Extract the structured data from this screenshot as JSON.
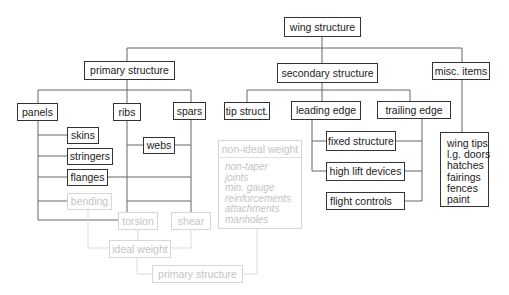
{
  "diagram": {
    "root": "wing structure",
    "level1": {
      "primary": "primary structure",
      "secondary": "secondary structure",
      "misc": "misc. items"
    },
    "primary_children": {
      "panels": "panels",
      "ribs": "ribs",
      "spars": "spars"
    },
    "panel_components": {
      "skins": "skins",
      "stringers": "stringers",
      "flanges": "flanges",
      "bending": "bending"
    },
    "spar_components": {
      "webs": "webs"
    },
    "loads": {
      "torsion": "torsion",
      "shear": "shear",
      "ideal_weight": "ideal weight",
      "primary_structure_result": "primary structure"
    },
    "non_ideal": {
      "title": "non-ideal weight",
      "items": [
        "non-taper",
        "joints",
        "min. gauge",
        "reinforcements",
        "attachments",
        "manholes"
      ]
    },
    "secondary_children": {
      "tip": "tip struct.",
      "leading_edge": "leading edge",
      "trailing_edge": "trailing edge"
    },
    "edge_components": {
      "fixed": "fixed structure",
      "high_lift": "high lift devices",
      "flight_controls": "flight controls"
    },
    "misc_items": [
      "wing tips",
      "l.g. doors",
      "hatches",
      "fairings",
      "fences",
      "paint"
    ]
  },
  "colors": {
    "solid_line": "#555555",
    "faint_line": "#d6d6d6",
    "faint_text": "#c4c4c4"
  }
}
